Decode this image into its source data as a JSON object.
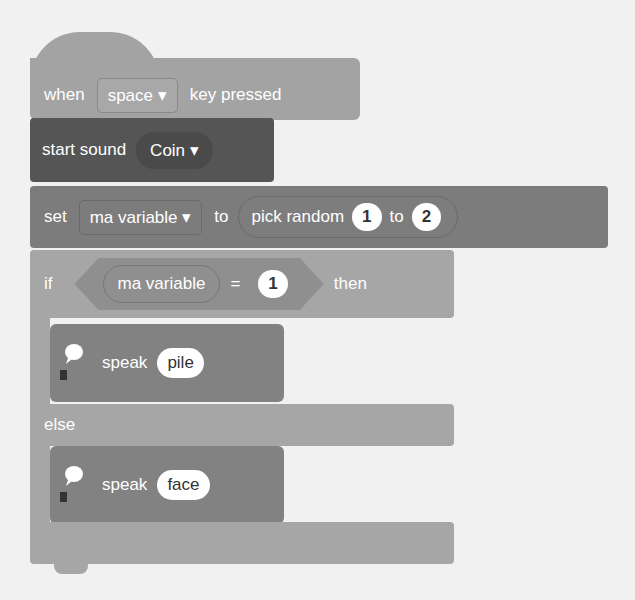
{
  "background_text": [
    "...ayoutquand...",
    "...n ... pro...",
    "... the...",
    "...ce ... ",
    "...ha ... "
  ],
  "script": {
    "hat": {
      "when": "when",
      "key": "space",
      "pressed": "key pressed"
    },
    "sound": {
      "label": "start sound",
      "sound": "Coin"
    },
    "set": {
      "label": "set",
      "variable": "ma variable",
      "to": "to",
      "random_label": "pick random",
      "from": "1",
      "to2": "to",
      "max": "2"
    },
    "if": {
      "label": "if",
      "variable": "ma variable",
      "op": "=",
      "value": "1",
      "then": "then"
    },
    "speak1": {
      "label": "speak",
      "text": "pile"
    },
    "else": {
      "label": "else"
    },
    "speak2": {
      "label": "speak",
      "text": "face"
    }
  }
}
